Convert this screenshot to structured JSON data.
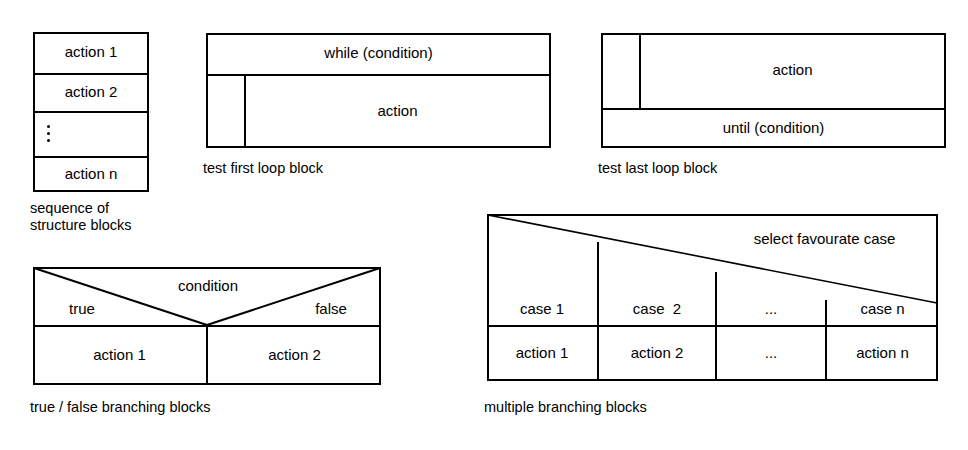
{
  "page": {
    "background_color": "#ffffff",
    "line_color": "#000000",
    "text_color": "#000000"
  },
  "figures": {
    "sequence": {
      "caption_line1": "sequence of",
      "caption_line2": "structure blocks",
      "rows": [
        {
          "label": "action 1"
        },
        {
          "label": "action 2"
        },
        {
          "label": "⋮"
        },
        {
          "label": "action n"
        }
      ]
    },
    "test_first_loop": {
      "caption": "test first loop block",
      "condition_label": "while (condition)",
      "body_label": "action"
    },
    "test_last_loop": {
      "caption": "test last loop block",
      "body_label": "action",
      "condition_label": "until (condition)"
    },
    "branching": {
      "caption": "true / false branching blocks",
      "condition_label": "condition",
      "true_label": "true",
      "false_label": "false",
      "true_action": "action 1",
      "false_action": "action 2"
    },
    "multi_branching": {
      "caption": "multiple branching blocks",
      "selector_label": "select favourate case",
      "cases": [
        "case 1",
        "case  2",
        "...",
        "case n"
      ],
      "actions": [
        "action 1",
        "action 2",
        "...",
        "action n"
      ]
    }
  }
}
